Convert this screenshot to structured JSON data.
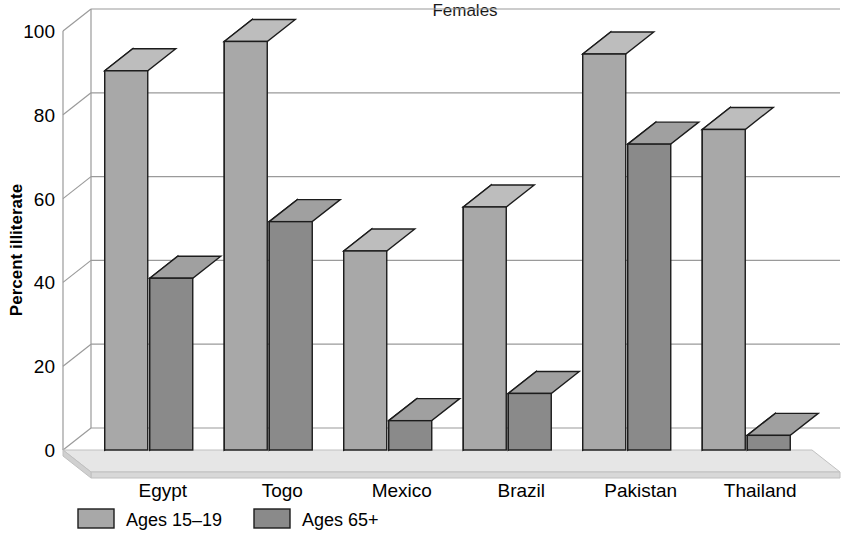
{
  "chart_data": {
    "type": "bar",
    "title": "Females",
    "xlabel": "",
    "ylabel": "Percent illiterate",
    "ylim": [
      0,
      100
    ],
    "yticks": [
      0,
      20,
      40,
      60,
      80,
      100
    ],
    "grid": true,
    "legend_position": "bottom-left",
    "categories": [
      "Egypt",
      "Togo",
      "Mexico",
      "Brazil",
      "Pakistan",
      "Thailand"
    ],
    "series": [
      {
        "name": "Ages 15–19",
        "color": "#a8a8a8",
        "side_color": "#6e6e6e",
        "top_color": "#bdbdbd",
        "values": [
          90.5,
          97.5,
          47.5,
          58,
          94.5,
          76.5
        ]
      },
      {
        "name": "Ages 65+",
        "color": "#8a8a8a",
        "side_color": "#5c5c5c",
        "top_color": "#a0a0a0",
        "values": [
          41,
          54.5,
          7,
          13.5,
          73,
          3.5
        ]
      }
    ]
  },
  "axis": {
    "tick_labels": [
      "100",
      "80",
      "60",
      "40",
      "20",
      "0"
    ],
    "y_title": "Percent illiterate"
  },
  "legend": {
    "items": [
      {
        "label": "Ages 15–19"
      },
      {
        "label": "Ages 65+"
      }
    ]
  },
  "colors": {
    "gridline": "#9a9a9a",
    "platform_top": "#e4e4e4",
    "platform_front": "#dcdcdc",
    "outline": "#1c1c1c",
    "text": "#000000"
  }
}
